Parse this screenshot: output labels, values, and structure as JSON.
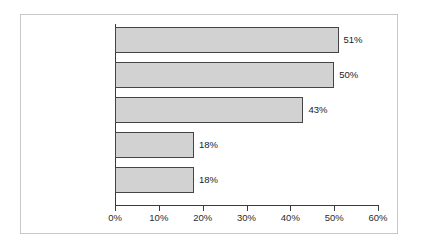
{
  "chart_data": {
    "type": "bar",
    "orientation": "horizontal",
    "title": "",
    "subtitle": "",
    "xlabel": "",
    "ylabel": "",
    "xlim": [
      0,
      60
    ],
    "grid": false,
    "legend": null,
    "categories": [
      "To motivate\nemployees",
      "To link pay to\nproductivity",
      "To retain specialist\nskills",
      "Other companies\ndoing it",
      "To control the\nwage bill"
    ],
    "values": [
      51,
      50,
      43,
      18,
      18
    ],
    "value_labels": [
      "51%",
      "50%",
      "43%",
      "18%",
      "18%"
    ],
    "x_tick_values": [
      0,
      10,
      20,
      30,
      40,
      50,
      60
    ],
    "x_tick_labels": [
      "0%",
      "10%",
      "20%",
      "30%",
      "40%",
      "50%",
      "60%"
    ]
  },
  "style": {
    "bar_fill": "#d2d2d2",
    "bar_border": "#454545",
    "axis_color": "#3a3a3a",
    "text_color": "#1c1c1c",
    "frame_color": "#c8c8c8",
    "background": "#ffffff"
  }
}
